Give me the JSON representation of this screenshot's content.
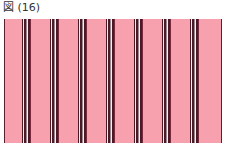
{
  "caption": "図 (16)",
  "colors": {
    "background": "#f7a1ae",
    "dark": "#4a1a26",
    "maroon": "#7a2a3c",
    "white": "#f4eef0",
    "gray": "#9a8a90"
  },
  "pattern": {
    "type": "vertical-stripes",
    "group_positions_px": [
      18,
      46,
      74,
      102,
      130,
      158,
      186
    ],
    "group_sequence": [
      "dark",
      "white",
      "dark",
      "gray",
      "white",
      "dark",
      "maroon"
    ]
  }
}
